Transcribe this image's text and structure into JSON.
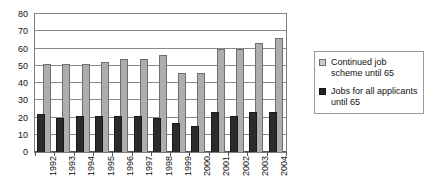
{
  "chart_data": {
    "type": "bar",
    "title": "",
    "subtitle": "",
    "xlabel": "",
    "ylabel": "",
    "ylim": [
      0,
      80
    ],
    "ytick_step": 10,
    "yticks": [
      "0",
      "10",
      "20",
      "30",
      "40",
      "50",
      "60",
      "70",
      "80"
    ],
    "grid": true,
    "legend_position": "right",
    "categories": [
      "1992",
      "1993",
      "1994",
      "1995",
      "1996",
      "1997",
      "1998",
      "1999",
      "2000",
      "2001",
      "2002",
      "2003",
      "2004"
    ],
    "series": [
      {
        "name": "Continued job scheme until 65",
        "color": "#adadad",
        "values": [
          51,
          51,
          51,
          52,
          54,
          54,
          56,
          46,
          46,
          60,
          60,
          63,
          66
        ]
      },
      {
        "name": "Jobs for all applicants until 65",
        "color": "#2b2b2b",
        "values": [
          22,
          20,
          21,
          21,
          21,
          21,
          20,
          17,
          15,
          23,
          21,
          23,
          23
        ]
      }
    ]
  },
  "legend": {
    "items": [
      {
        "label": "Continued job scheme until 65",
        "swatch": "light-gray-square-icon"
      },
      {
        "label": "Jobs for all applicants until 65",
        "swatch": "dark-filled-square-icon"
      }
    ]
  },
  "colors": {
    "series_light": "#adadad",
    "series_dark": "#2b2b2b",
    "gridline": "#8a8a8a",
    "frame": "#7d7d7d",
    "background": "#ffffff",
    "text": "#111111"
  }
}
